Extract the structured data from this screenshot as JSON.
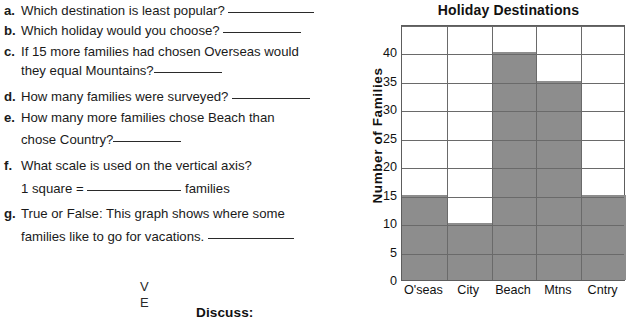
{
  "worksheet": {
    "questions": [
      {
        "letter": "a.",
        "text": "Which destination is least popular?",
        "blank": "long",
        "top": 2
      },
      {
        "letter": "b.",
        "text": "Which holiday would you choose?",
        "blank": "mid",
        "top": 22
      },
      {
        "letter": "c.",
        "text": "If 15 more families had chosen Overseas would",
        "blank": "none",
        "top": 44,
        "cont": "they equal Mountains?",
        "cont_blank": "short",
        "cont_top": 62
      },
      {
        "letter": "d.",
        "text": "How many families were surveyed?",
        "blank": "mid",
        "top": 88
      },
      {
        "letter": "e.",
        "text": "How many more families chose Beach than",
        "blank": "none",
        "top": 110,
        "cont": "chose Country?",
        "cont_blank": "short",
        "cont_top": 131
      },
      {
        "letter": "f.",
        "text": "What scale is used on the vertical axis?",
        "blank": "none",
        "top": 158,
        "cont": "1 square = ",
        "cont_blank": "xl",
        "cont_suffix": " families",
        "cont_top": 180
      },
      {
        "letter": "g.",
        "text": "True or False:  This graph shows where some",
        "blank": "none",
        "top": 206,
        "cont": "families like to go for vacations. ",
        "cont_blank": "long",
        "cont_top": 228
      }
    ],
    "margin_marks": [
      {
        "char": "V",
        "left": 140,
        "top": 280
      },
      {
        "char": "E",
        "left": 140,
        "top": 296
      }
    ],
    "discuss_label": "Discuss:"
  },
  "chart_data": {
    "type": "bar",
    "title": "Holiday Destinations",
    "xlabel": "",
    "ylabel": "Number of Families",
    "categories": [
      "O'seas",
      "City",
      "Beach",
      "Mtns",
      "Cntry"
    ],
    "values": [
      15,
      10,
      40,
      35,
      15
    ],
    "ylim": [
      0,
      45
    ],
    "yticks": [
      0,
      5,
      10,
      15,
      20,
      25,
      30,
      35,
      40
    ],
    "grid": true,
    "legend": "none",
    "bar_color": "#8d8d8d",
    "grid_color": "#6a6a6a",
    "axis_color": "#5d5d5d"
  }
}
